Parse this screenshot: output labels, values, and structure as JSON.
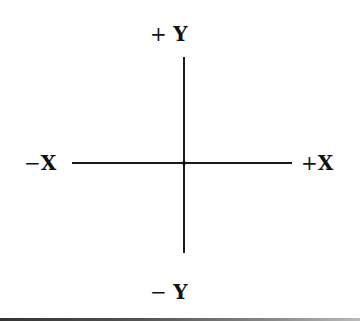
{
  "diagram": {
    "title": "",
    "type": "cartesian-axes",
    "labels": {
      "positive_y": {
        "sign": "+",
        "var": "Y"
      },
      "negative_y": {
        "sign": "−",
        "var": "Y"
      },
      "negative_x": {
        "sign": "−",
        "var": "X"
      },
      "positive_x": {
        "sign": "+",
        "var": "X"
      }
    },
    "colors": {
      "line": "#1a1a1a",
      "text": "#111111",
      "background": "#ffffff"
    }
  }
}
